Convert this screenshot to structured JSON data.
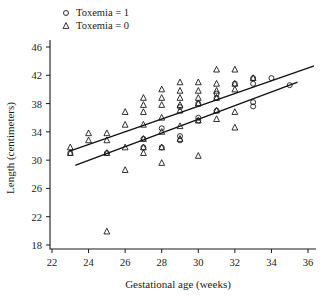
{
  "chart_data": {
    "type": "scatter",
    "title": "",
    "xlabel": "Gestational age (weeks)",
    "ylabel": "Length (centimeters)",
    "xlim": [
      22,
      36
    ],
    "ylim": [
      18,
      46
    ],
    "xticks": [
      22,
      24,
      26,
      28,
      30,
      32,
      34,
      36
    ],
    "yticks": [
      18,
      22,
      26,
      30,
      34,
      38,
      42,
      46
    ],
    "grid": false,
    "legend_position": "top-left-outside",
    "legend": [
      {
        "label": "Toxemia = 1",
        "marker": "circle"
      },
      {
        "label": "Toxemia = 0",
        "marker": "triangle"
      }
    ],
    "series": [
      {
        "name": "Toxemia = 0",
        "marker": "triangle",
        "points": [
          [
            23,
            31.8
          ],
          [
            23,
            31.0
          ],
          [
            24,
            33.8
          ],
          [
            24,
            32.8
          ],
          [
            25,
            33.8
          ],
          [
            25,
            32.8
          ],
          [
            25,
            31.0
          ],
          [
            25,
            19.9
          ],
          [
            26,
            36.8
          ],
          [
            26,
            35.0
          ],
          [
            26,
            31.8
          ],
          [
            26,
            28.6
          ],
          [
            27,
            38.8
          ],
          [
            27,
            37.8
          ],
          [
            27,
            36.8
          ],
          [
            27,
            35.0
          ],
          [
            27,
            33.0
          ],
          [
            27,
            31.8
          ],
          [
            27,
            31.0
          ],
          [
            28,
            40.0
          ],
          [
            28,
            38.8
          ],
          [
            28,
            37.8
          ],
          [
            28,
            36.0
          ],
          [
            28,
            34.0
          ],
          [
            28,
            31.8
          ],
          [
            28,
            29.6
          ],
          [
            29,
            41.0
          ],
          [
            29,
            39.8
          ],
          [
            29,
            38.8
          ],
          [
            29,
            37.8
          ],
          [
            29,
            37.0
          ],
          [
            29,
            34.8
          ],
          [
            29,
            33.0
          ],
          [
            30,
            41.0
          ],
          [
            30,
            39.8
          ],
          [
            30,
            38.8
          ],
          [
            30,
            38.0
          ],
          [
            30,
            35.6
          ],
          [
            30,
            30.6
          ],
          [
            31,
            42.8
          ],
          [
            31,
            40.8
          ],
          [
            31,
            39.8
          ],
          [
            31,
            38.8
          ],
          [
            31,
            37.0
          ],
          [
            31,
            35.8
          ],
          [
            32,
            42.8
          ],
          [
            32,
            40.8
          ],
          [
            32,
            40.0
          ],
          [
            32,
            36.8
          ],
          [
            32,
            34.6
          ],
          [
            33,
            41.6
          ]
        ]
      },
      {
        "name": "Toxemia = 1",
        "marker": "circle",
        "points": [
          [
            23,
            31.0
          ],
          [
            25,
            31.0
          ],
          [
            27,
            33.0
          ],
          [
            27,
            31.8
          ],
          [
            28,
            34.5
          ],
          [
            28,
            31.8
          ],
          [
            29,
            37.5
          ],
          [
            29,
            33.4
          ],
          [
            29,
            32.8
          ],
          [
            30,
            38.0
          ],
          [
            30,
            36.0
          ],
          [
            30,
            35.6
          ],
          [
            31,
            39.4
          ],
          [
            31,
            38.8
          ],
          [
            31,
            37.0
          ],
          [
            32,
            40.8
          ],
          [
            33,
            41.6
          ],
          [
            33,
            40.8
          ],
          [
            33,
            38.2
          ],
          [
            33,
            37.6
          ],
          [
            34,
            41.6
          ],
          [
            35,
            40.6
          ]
        ]
      }
    ],
    "fit_lines": [
      {
        "name": "Toxemia = 0 fit",
        "x0": 23.0,
        "y0": 31.3,
        "x1": 36.3,
        "y1": 43.3
      },
      {
        "name": "Toxemia = 1 fit",
        "x0": 23.3,
        "y0": 29.3,
        "x1": 35.4,
        "y1": 41.0
      }
    ]
  }
}
